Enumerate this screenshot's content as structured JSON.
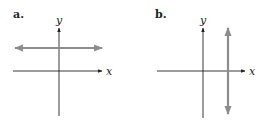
{
  "panels": [
    {
      "label": "a.",
      "x_axis_label": "x",
      "y_axis_label": "y",
      "line_type": "horizontal",
      "line_color": "#8c8c8c"
    },
    {
      "label": "b.",
      "x_axis_label": "x",
      "y_axis_label": "y",
      "line_type": "vertical",
      "line_color": "#8c8c8c"
    }
  ],
  "colors": {
    "axis": "#222222",
    "graph_line": "#8c8c8c"
  }
}
